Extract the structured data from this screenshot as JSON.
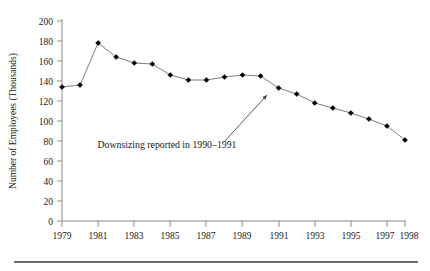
{
  "chart_data": {
    "type": "line",
    "title": "",
    "subtitle": "",
    "xlabel": "",
    "ylabel": "Number of  Employees (Thousands)",
    "xlim": [
      1979,
      1998
    ],
    "ylim": [
      0,
      200
    ],
    "grid": false,
    "legend": null,
    "legend_position": "none",
    "x": [
      1979,
      1980,
      1981,
      1982,
      1983,
      1984,
      1985,
      1986,
      1987,
      1988,
      1989,
      1990,
      1991,
      1992,
      1993,
      1994,
      1995,
      1996,
      1997,
      1998
    ],
    "values": [
      134,
      136,
      178,
      164,
      158,
      157,
      146,
      141,
      141,
      144,
      146,
      145,
      133,
      127,
      118,
      113,
      108,
      102,
      95,
      81
    ],
    "series": [
      {
        "name": "Number of Employees",
        "values": [
          134,
          136,
          178,
          164,
          158,
          157,
          146,
          141,
          141,
          144,
          146,
          145,
          133,
          127,
          118,
          113,
          108,
          102,
          95,
          81
        ]
      }
    ],
    "ytick_labels": [
      "0",
      "20",
      "40",
      "60",
      "80",
      "100",
      "120",
      "140",
      "160",
      "180",
      "200"
    ],
    "ytick_values": [
      0,
      20,
      40,
      60,
      80,
      100,
      120,
      140,
      160,
      180,
      200
    ],
    "xtick_labels": [
      "1979",
      "1981",
      "1983",
      "1985",
      "1987",
      "1989",
      "1991",
      "1993",
      "1995",
      "1997",
      "1998"
    ],
    "xtick_values": [
      1979,
      1981,
      1983,
      1985,
      1987,
      1989,
      1991,
      1993,
      1995,
      1997,
      1998
    ],
    "annotations": [
      {
        "text": "Downsizing reported in 1990–1991",
        "points_to_x": 1990,
        "points_to_y": 145
      }
    ],
    "marker_style": "filled-diamond",
    "line_color": "#6f6f6f",
    "marker_color": "#000000",
    "axis_color": "#8a8a8a"
  },
  "figure": {
    "ylabel": "Number of  Employees (Thousands)",
    "annotation": "Downsizing reported in 1990–1991",
    "ytick_0": "0",
    "ytick_20": "20",
    "ytick_40": "40",
    "ytick_60": "60",
    "ytick_80": "80",
    "ytick_100": "100",
    "ytick_120": "120",
    "ytick_140": "140",
    "ytick_160": "160",
    "ytick_180": "180",
    "ytick_200": "200",
    "xtick_1979": "1979",
    "xtick_1981": "1981",
    "xtick_1983": "1983",
    "xtick_1985": "1985",
    "xtick_1987": "1987",
    "xtick_1989": "1989",
    "xtick_1991": "1991",
    "xtick_1993": "1993",
    "xtick_1995": "1995",
    "xtick_1997": "1997",
    "xtick_1998": "1998"
  }
}
